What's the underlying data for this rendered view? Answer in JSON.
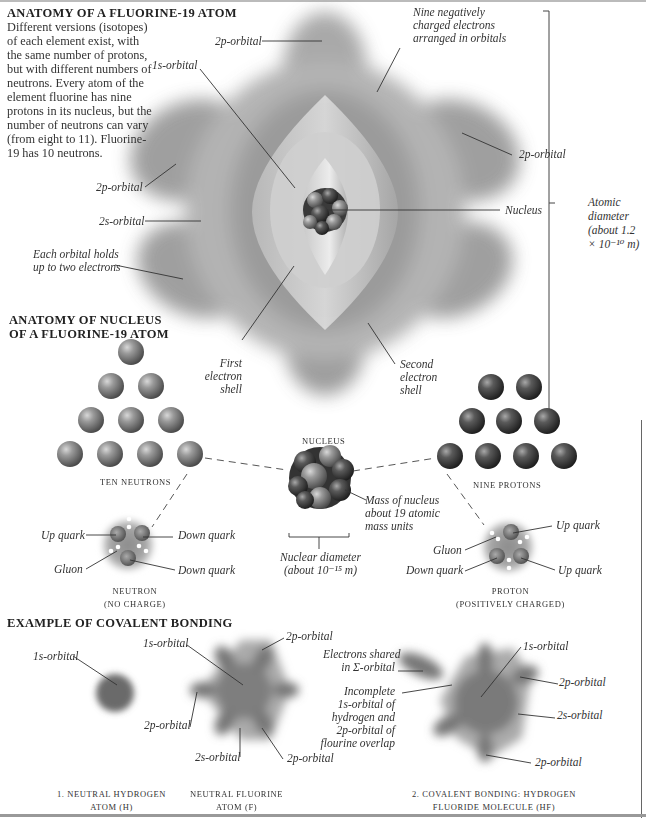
{
  "atom_section": {
    "title": "ANATOMY OF A FLUORINE-19 ATOM",
    "intro": "Different versions (isotopes) of each element exist, with the same number of protons, but with different numbers of neutrons. Every atom of the element fluorine has nine protons in its nucleus, but the number of neutrons can vary (from eight to 11). Fluorine-19 has 10 neutrons.",
    "labels": {
      "top_2p": "2p-orbital",
      "nine_electrons": [
        "Nine negatively",
        "charged electrons",
        "arranged in orbitals"
      ],
      "one_s": "1s-orbital",
      "right_2p": "2p-orbital",
      "left_2p": "2p-orbital",
      "two_s": "2s-orbital",
      "nucleus": "Nucleus",
      "each_orbital": [
        "Each orbital holds",
        "up to two electrons"
      ],
      "atomic_diameter": [
        "Atomic",
        "diameter",
        "(about 1.2",
        "× 10⁻¹⁰ m)"
      ],
      "first_shell": [
        "First",
        "electron",
        "shell"
      ],
      "second_shell": [
        "Second",
        "electron",
        "shell"
      ]
    }
  },
  "nucleus_section": {
    "title_lines": [
      "ANATOMY OF NUCLEUS",
      "OF A FLUORINE-19 ATOM"
    ],
    "neutrons_caption": "TEN NEUTRONS",
    "protons_caption": "NINE PROTONS",
    "nucleus_caption": "NUCLEUS",
    "mass_label": [
      "Mass of nucleus",
      "about 19 atomic",
      "mass units"
    ],
    "diameter_label": [
      "Nuclear diameter",
      "(about 10⁻¹⁵ m)"
    ],
    "neutron_count": 10,
    "proton_count": 9,
    "neutron": {
      "labels": {
        "up_quark": "Up quark",
        "down_quark_1": "Down quark",
        "gluon": "Gluon",
        "down_quark_2": "Down quark"
      },
      "caption": [
        "NEUTRON",
        "(NO CHARGE)"
      ]
    },
    "proton": {
      "labels": {
        "up_quark_1": "Up quark",
        "gluon": "Gluon",
        "down_quark": "Down quark",
        "up_quark_2": "Up quark"
      },
      "caption": [
        "PROTON",
        "(POSITIVELY CHARGED)"
      ]
    }
  },
  "bonding_section": {
    "title": "EXAMPLE OF COVALENT BONDING",
    "hydrogen": {
      "label": "1s-orbital",
      "caption": [
        "1. NEUTRAL HYDROGEN",
        "ATOM (H)"
      ]
    },
    "fluorine": {
      "labels": {
        "one_s": "1s-orbital",
        "two_p_top": "2p-orbital",
        "two_p_left": "2p-orbital",
        "two_s": "2s-orbital",
        "two_p_bottom": "2p-orbital"
      },
      "caption": [
        "NEUTRAL FLUORINE",
        "ATOM (F)"
      ]
    },
    "hf": {
      "labels": {
        "shared": [
          "Electrons shared",
          "in Σ-orbital"
        ],
        "overlap": [
          "Incomplete",
          "1s-orbital of",
          "hydrogen and",
          "2p-orbital of",
          "flourine overlap"
        ],
        "one_s": "1s-orbital",
        "two_p_right": "2p-orbital",
        "two_s": "2s-orbital",
        "two_p_bottom": "2p-orbital"
      },
      "caption": [
        "2. COVALENT BONDING: HYDROGEN",
        "FLUORIDE MOLECULE (HF)"
      ]
    }
  },
  "colors": {
    "orbital": "#6e6e6e",
    "neutron": "#7a7a7a",
    "proton": "#3e3e3e",
    "leader": "#333333"
  }
}
